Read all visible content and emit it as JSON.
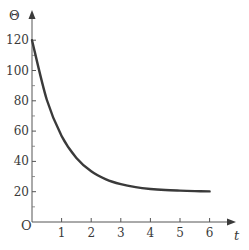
{
  "chart_data": {
    "type": "line",
    "title": "",
    "xlabel": "t",
    "ylabel": "Θ",
    "origin_label": "O",
    "xlim": [
      0,
      7
    ],
    "ylim": [
      0,
      135
    ],
    "x_ticks": [
      1,
      2,
      3,
      4,
      5,
      6
    ],
    "x_tick_labels": [
      "1",
      "2",
      "3",
      "4",
      "5",
      "6"
    ],
    "y_ticks": [
      20,
      40,
      60,
      80,
      100,
      120
    ],
    "y_tick_labels": [
      "20",
      "40",
      "60",
      "80",
      "100",
      "120"
    ],
    "y_minor_ticks": [
      10,
      30,
      50,
      70,
      90,
      110
    ],
    "grid": false,
    "legend": null,
    "series": [
      {
        "name": "Θ(t)",
        "description": "exponential decay from 120 towards 20",
        "x": [
          0,
          0.5,
          1,
          1.5,
          2,
          2.5,
          3,
          3.5,
          4,
          4.5,
          5,
          5.5,
          6
        ],
        "values": [
          120,
          80.7,
          56.8,
          42.3,
          33.5,
          28.2,
          25.0,
          23.0,
          21.8,
          21.1,
          20.7,
          20.4,
          20.2
        ],
        "color": "#3a3a3a"
      }
    ]
  }
}
